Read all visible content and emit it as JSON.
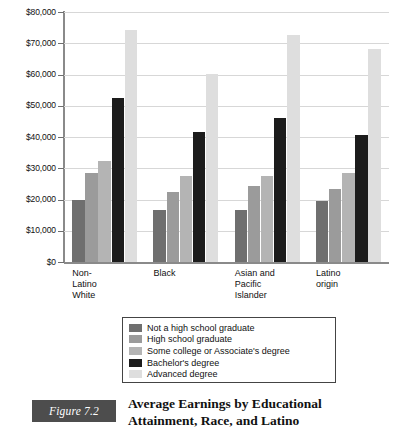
{
  "chart_data": {
    "type": "bar",
    "title": "Average Earnings by Educational Attainment, Race, and Latino",
    "xlabel": "",
    "ylabel": "",
    "ylim": [
      0,
      80000
    ],
    "grid": true,
    "legend_position": "bottom",
    "categories": [
      "Non-\nLatino\nWhite",
      "Black",
      "Asian and\nPacific\nIslander",
      "Latino\norigin"
    ],
    "ytick_labels": [
      "$80,000",
      "$70,000",
      "$60,000",
      "$50,000",
      "$40,000",
      "$30,000",
      "$20,000",
      "$10,000",
      "$0"
    ],
    "ytick_values": [
      80000,
      70000,
      60000,
      50000,
      40000,
      30000,
      20000,
      10000,
      0
    ],
    "series": [
      {
        "name": "Not a high school graduate",
        "color": "#6f6f6f",
        "values": [
          19700,
          16600,
          16800,
          19400
        ]
      },
      {
        "name": "High school graduate",
        "color": "#9b9b9b",
        "values": [
          28400,
          22500,
          24300,
          23400
        ]
      },
      {
        "name": "Some college or Associate's degree",
        "color": "#b4b4b4",
        "values": [
          32200,
          27500,
          27600,
          28400
        ]
      },
      {
        "name": "Bachelor's degree",
        "color": "#1c1c1c",
        "values": [
          52600,
          41600,
          46200,
          40800
        ]
      },
      {
        "name": "Advanced degree",
        "color": "#dedede",
        "values": [
          74300,
          60200,
          72800,
          68100
        ]
      }
    ]
  },
  "caption": {
    "figure_tag": "Figure 7.2",
    "title_line_1": "Average Earnings by Educational",
    "title_line_2": "Attainment, Race, and Latino",
    "tag_background": "#4d4d4d",
    "tag_text_color": "#ffffff"
  },
  "axis": {
    "axis_color": "#8a8a8a",
    "grid_color": "#d7d7d7"
  }
}
